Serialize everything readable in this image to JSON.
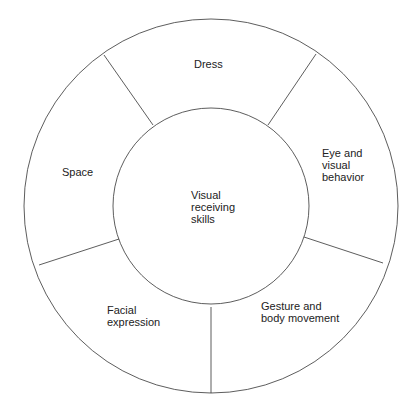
{
  "diagram": {
    "center": {
      "label": "Visual\nreceiving\nskills"
    },
    "segments": [
      {
        "label": "Dress"
      },
      {
        "label": "Eye and\nvisual\nbehavior"
      },
      {
        "label": "Gesture and\nbody movement"
      },
      {
        "label": "Facial\nexpression"
      },
      {
        "label": "Space"
      }
    ],
    "colors": {
      "stroke": "#333333",
      "text": "#222222",
      "background": "#ffffff"
    }
  }
}
